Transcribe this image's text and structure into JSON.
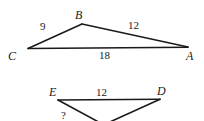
{
  "figure": {
    "stroke_color": "#1a1a1a",
    "background_color": "#ffffff",
    "upper_triangle": {
      "name": "triangle-abc",
      "vertices": [
        {
          "key": "C",
          "label": "C",
          "x": 28,
          "y": 48
        },
        {
          "key": "B",
          "label": "B",
          "x": 82,
          "y": 24
        },
        {
          "key": "A",
          "label": "A",
          "x": 188,
          "y": 47
        }
      ],
      "sides": [
        {
          "key": "CB",
          "label": "9",
          "from": "C",
          "to": "B"
        },
        {
          "key": "BA",
          "label": "12",
          "from": "B",
          "to": "A"
        },
        {
          "key": "CA",
          "label": "18",
          "from": "C",
          "to": "A"
        }
      ]
    },
    "lower_triangle": {
      "name": "triangle-edf",
      "note": "third vertex extends below the visible crop",
      "vertices": [
        {
          "key": "E",
          "label": "E",
          "x": 58,
          "y": 100
        },
        {
          "key": "D",
          "label": "D",
          "x": 160,
          "y": 99
        },
        {
          "key": "F",
          "label": "",
          "x": 104,
          "y": 127
        }
      ],
      "sides": [
        {
          "key": "ED",
          "label": "12",
          "from": "E",
          "to": "D"
        },
        {
          "key": "EF",
          "label": "?",
          "from": "E",
          "to": "F"
        },
        {
          "key": "FD",
          "label": "",
          "from": "F",
          "to": "D"
        }
      ]
    }
  }
}
